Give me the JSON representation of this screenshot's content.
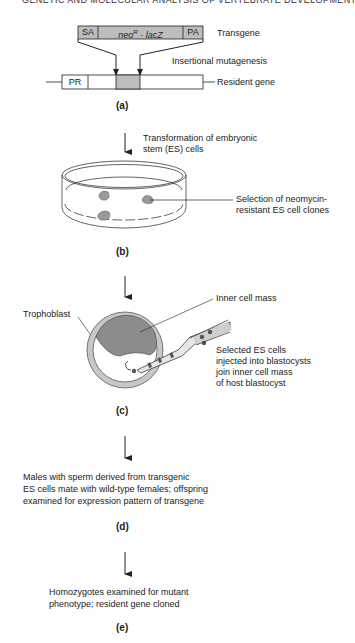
{
  "header": {
    "title": "GENETIC AND MOLECULAR ANALYSIS OF VERTEBRATE DEVELOPMENT"
  },
  "panel_a": {
    "transgene_segments": [
      "SA",
      "neo",
      "R",
      " - lacZ",
      "PA"
    ],
    "transgene_label": "Transgene",
    "process_label": "Insertional mutagenesis",
    "resident_segments": [
      "PR"
    ],
    "resident_label": "Resident gene",
    "caption": "(a)"
  },
  "step_ab": {
    "text_line1": "Transformation of embryonic",
    "text_line2": "stem (ES) cells"
  },
  "panel_b": {
    "label_line1": "Selection of neomycin-",
    "label_line2": "resistant ES cell clones",
    "caption": "(b)"
  },
  "panel_c": {
    "trophoblast_label": "Trophoblast",
    "inner_cell_mass_label": "Inner cell mass",
    "injection_lines": [
      "Selected ES cells",
      "injected into blastocysts",
      "join inner cell mass",
      "of host blastocyst"
    ],
    "caption": "(c)"
  },
  "panel_d": {
    "lines": [
      "Males with sperm derived from transgenic",
      "ES cells mate with wild-type females; offspring",
      "examined for expression pattern of transgene"
    ],
    "caption": "(d)"
  },
  "panel_e": {
    "lines": [
      "Homozygotes examined for mutant",
      "phenotype; resident gene cloned"
    ],
    "caption": "(e)"
  },
  "colors": {
    "gray_fill": "#bdbdbd",
    "dark_gray": "#8c8c8c",
    "ring_gray": "#c8c8c8",
    "stroke": "#222222"
  }
}
